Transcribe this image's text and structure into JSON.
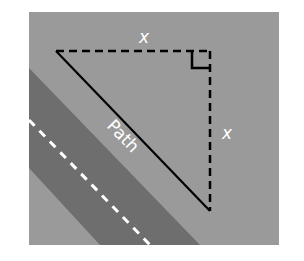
{
  "diagram": {
    "title": "",
    "labels": {
      "top_side": "x",
      "right_side": "x",
      "hypotenuse": "Path"
    },
    "colors": {
      "background_field": "#9a9a9a",
      "road_band": "#6e6e6e",
      "road_center_line": "#ffffff",
      "triangle_lines": "#000000",
      "label_text": "#ffffff",
      "page": "#ffffff"
    },
    "shapes": [
      {
        "kind": "square-field",
        "description": "gray background field"
      },
      {
        "kind": "diagonal-band",
        "description": "dark road band running diagonally"
      },
      {
        "kind": "dashed-centerline",
        "description": "white dashed line inside road band"
      },
      {
        "kind": "right-triangle",
        "legs": "dashed",
        "hypotenuse": "solid",
        "right_angle_marker": true
      }
    ]
  }
}
